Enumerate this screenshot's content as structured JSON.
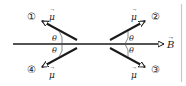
{
  "diagram": {
    "field_label": "B",
    "angle_label": "θ",
    "vector_label": "μ",
    "vectors": [
      {
        "id": "1",
        "marker": "①"
      },
      {
        "id": "2",
        "marker": "②"
      },
      {
        "id": "3",
        "marker": "③"
      },
      {
        "id": "4",
        "marker": "④"
      }
    ],
    "colors": {
      "stroke": "#1a1a1a",
      "divider": "#c8c8c8"
    }
  }
}
